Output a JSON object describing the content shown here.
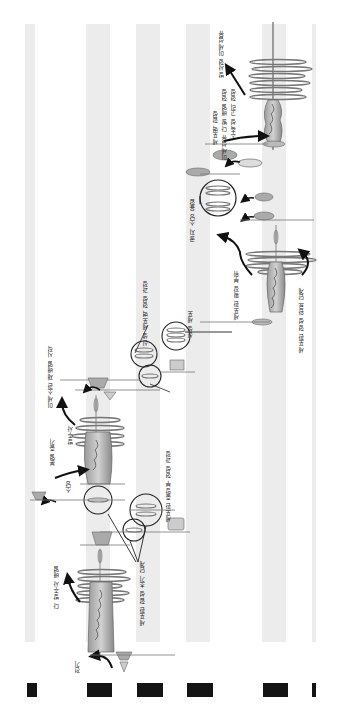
{
  "diagram": {
    "orientation": "rotated-180",
    "bands": [
      {
        "x": 25,
        "w": 10
      },
      {
        "x": 86,
        "w": 24
      },
      {
        "x": 136,
        "w": 24
      },
      {
        "x": 186,
        "w": 24
      },
      {
        "x": 262,
        "w": 24
      },
      {
        "x": 312,
        "w": 4
      }
    ],
    "bars": [
      {
        "x": 27,
        "w": 10
      },
      {
        "x": 87,
        "w": 25
      },
      {
        "x": 137,
        "w": 26
      },
      {
        "x": 187,
        "w": 26
      },
      {
        "x": 263,
        "w": 25
      },
      {
        "x": 312,
        "w": 4
      }
    ],
    "labels": [
      {
        "id": "l1",
        "text": "방사형 미세섬유",
        "x": 217,
        "y": 30
      },
      {
        "id": "l2",
        "text": "수축성 고리 형성",
        "x": 229,
        "y": 88
      },
      {
        "id": "l3",
        "text": "미세섬유 다발 배열 형성",
        "x": 220,
        "y": 88
      },
      {
        "id": "l4",
        "text": "세포벽 합성",
        "x": 211,
        "y": 110
      },
      {
        "id": "l5",
        "text": "골지 소낭 융합",
        "x": 188,
        "y": 198
      },
      {
        "id": "l6",
        "text": "세포판 형성 완료 단계",
        "x": 297,
        "y": 287
      },
      {
        "id": "l7",
        "text": "세포판 확장 부위",
        "x": 232,
        "y": 270
      },
      {
        "id": "l8",
        "text": "신생 세포벽 형성 과정",
        "x": 141,
        "y": 280
      },
      {
        "id": "l9",
        "text": "신생 세포",
        "x": 186,
        "y": 310
      },
      {
        "id": "l10",
        "text": "미세소관 재배열 시작",
        "x": 46,
        "y": 345
      },
      {
        "id": "l11",
        "text": "방추사",
        "x": 66,
        "y": 425
      },
      {
        "id": "l12",
        "text": "분열 중기",
        "x": 48,
        "y": 438
      },
      {
        "id": "l13",
        "text": "소낭",
        "x": 64,
        "y": 480
      },
      {
        "id": "l14",
        "text": "세포판 중앙부 형성 과정",
        "x": 164,
        "y": 450
      },
      {
        "id": "l15",
        "text": "세포판 합성 초기 단계",
        "x": 138,
        "y": 560
      },
      {
        "id": "l16",
        "text": "다 방추사 배열",
        "x": 52,
        "y": 565
      },
      {
        "id": "l17",
        "text": "전기",
        "x": 73,
        "y": 660
      }
    ]
  }
}
